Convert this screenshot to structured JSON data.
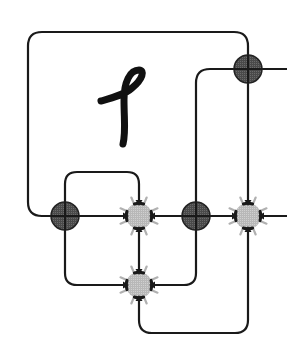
{
  "diagram": {
    "type": "string-diagram",
    "glyph": {
      "symbol": "𝓁",
      "description": "handwritten cursive loop letter inside outer box"
    },
    "colors": {
      "wire": "#1a1a1a",
      "dark_node_fill": "#555555",
      "dark_node_stroke": "#222222",
      "burst_node_fill": "#bbbbbb",
      "burst_spikes_outer": "#aaaaaa",
      "burst_spikes_inner": "#1a1a1a",
      "background": "#ffffff"
    },
    "nodes": [
      {
        "id": "dark-top-right",
        "kind": "dark-crossed-circle",
        "x": 248,
        "y": 69
      },
      {
        "id": "dark-left",
        "kind": "dark-crossed-circle",
        "x": 65,
        "y": 216
      },
      {
        "id": "dark-middle",
        "kind": "dark-crossed-circle",
        "x": 196,
        "y": 216
      },
      {
        "id": "burst-center",
        "kind": "starburst",
        "x": 139,
        "y": 216
      },
      {
        "id": "burst-right",
        "kind": "starburst",
        "x": 248,
        "y": 216
      },
      {
        "id": "burst-bottom",
        "kind": "starburst",
        "x": 139,
        "y": 285
      }
    ]
  }
}
